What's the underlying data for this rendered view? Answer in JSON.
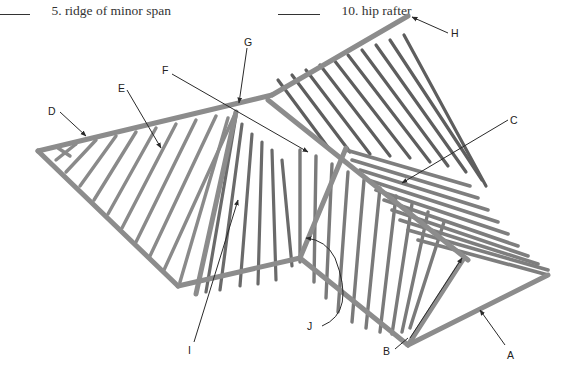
{
  "questions": [
    {
      "number": "5.",
      "text": "ridge of minor span"
    },
    {
      "number": "10.",
      "text": "hip rafter"
    }
  ],
  "diagram": {
    "labels": [
      "A",
      "B",
      "C",
      "D",
      "E",
      "F",
      "G",
      "H",
      "I",
      "J"
    ],
    "colors": {
      "member": "#8a8a8a",
      "member_dark": "#5e5e5e",
      "leader": "#2a2a2a"
    }
  }
}
